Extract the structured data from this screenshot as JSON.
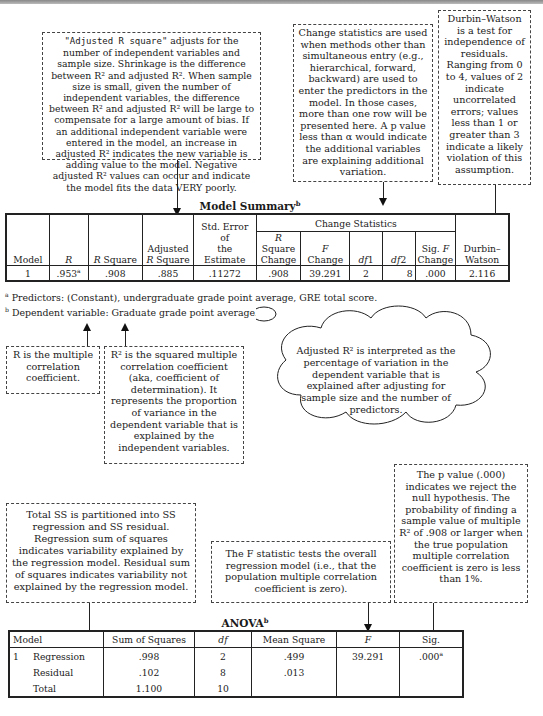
{
  "annotations": {
    "adjusted_r_square": {
      "lead_mono": "\"Adjusted R square\"",
      "text": "adjusts for the number of independent variables and sample size. Shrinkage is the difference between R² and adjusted R². When sample size is small, given the number of independent variables, the difference between R² and adjusted R² will be large to compensate for a large amount of bias. If an additional independent variable were entered in the model, an increase in adjusted R² indicates the new variable is adding value to the model. Negative adjusted R² values can occur and indicate the model fits the data VERY poorly."
    },
    "change_statistics": "Change statistics are used when methods other than simultaneous entry (e.g., hierarchical, forward, backward) are used to enter the predictors in the model. In those cases, more than one row will be presented here. A p value less than α would indicate the additional variables are explaining additional variation.",
    "durbin_watson": "Durbin–Watson is a test for independence of residuals. Ranging from 0 to 4, values of 2 indicate uncorrelated errors; values less than 1 or greater than 3 indicate a likely violation of this assumption.",
    "r_multiple": "R is the multiple correlation coefficient.",
    "r_squared": "R² is the squared multiple correlation coefficient (aka, coefficient of determination). It represents the proportion of variance in the dependent variable that is explained by the independent variables.",
    "adjusted_cloud": "Adjusted R² is interpreted as the percentage of variation in the dependent variable that is explained after adjusting for sample size and the number of predictors.",
    "total_ss": "Total SS is partitioned into SS regression and SS residual. Regression sum of squares indicates variability explained by the regression model. Residual sum of squares indicates variability not explained by the regression model.",
    "f_statistic": "The F statistic tests the overall regression model (i.e., that the population multiple correlation coefficient is zero).",
    "p_value": "The p value (.000) indicates we reject the null hypothesis. The probability of finding a sample value of multiple R² of .908 or larger when the true population multiple correlation coefficient is zero is less than 1%."
  },
  "model_summary": {
    "title": "Model Summary",
    "title_sup": "b",
    "group_header": "Change Statistics",
    "headers": [
      "Model",
      "R",
      "R Square",
      "Adjusted R Square",
      "Std. Error of the Estimate",
      "R Square Change",
      "F Change",
      "df1",
      "df2",
      "Sig. F Change",
      "Durbin–Watson"
    ],
    "row": {
      "model": "1",
      "r": ".953",
      "r_sup": "a",
      "r_square": ".908",
      "adj_r_square": ".885",
      "std_error": ".11272",
      "r_square_change": ".908",
      "f_change": "39.291",
      "df1": "2",
      "df2": "8",
      "sig_f_change": ".000",
      "durbin_watson": "2.116"
    },
    "footnote_a": "Predictors: (Constant), undergraduate grade point average, GRE total score.",
    "footnote_b": "Dependent variable: Graduate grade point average."
  },
  "anova": {
    "title": "ANOVA",
    "title_sup": "b",
    "headers": [
      "Model",
      "Sum of Squares",
      "df",
      "Mean Square",
      "F",
      "Sig."
    ],
    "rows": [
      {
        "model": "1",
        "source": "Regression",
        "ss": ".998",
        "df": "2",
        "ms": ".499",
        "f": "39.291",
        "sig": ".000",
        "sig_sup": "a"
      },
      {
        "model": "",
        "source": "Residual",
        "ss": ".102",
        "df": "8",
        "ms": ".013",
        "f": "",
        "sig": ""
      },
      {
        "model": "",
        "source": "Total",
        "ss": "1.100",
        "df": "10",
        "ms": "",
        "f": "",
        "sig": ""
      }
    ]
  }
}
